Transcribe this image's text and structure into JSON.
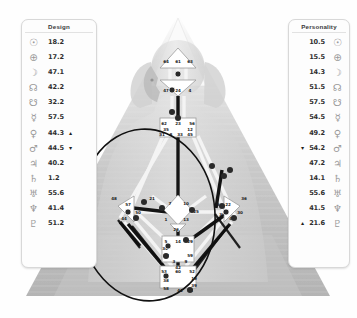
{
  "design": {
    "title": "Design",
    "rows": [
      {
        "icon": "sun-icon",
        "glyph": "☉",
        "value": "18.2",
        "arrow": ""
      },
      {
        "icon": "earth-icon",
        "glyph": "⊕",
        "value": "17.2",
        "arrow": ""
      },
      {
        "icon": "moon-icon",
        "glyph": "☽",
        "value": "47.1",
        "arrow": ""
      },
      {
        "icon": "north-node-icon",
        "glyph": "☊",
        "value": "42.2",
        "arrow": ""
      },
      {
        "icon": "south-node-icon",
        "glyph": "☋",
        "value": "32.2",
        "arrow": ""
      },
      {
        "icon": "mercury-icon",
        "glyph": "☿",
        "value": "57.5",
        "arrow": ""
      },
      {
        "icon": "venus-icon",
        "glyph": "♀",
        "value": "44.3",
        "arrow": "▲"
      },
      {
        "icon": "mars-icon",
        "glyph": "♂",
        "value": "44.5",
        "arrow": "▼"
      },
      {
        "icon": "jupiter-icon",
        "glyph": "♃",
        "value": "40.2",
        "arrow": ""
      },
      {
        "icon": "saturn-icon",
        "glyph": "♄",
        "value": "1.2",
        "arrow": ""
      },
      {
        "icon": "uranus-icon",
        "glyph": "♅",
        "value": "55.6",
        "arrow": ""
      },
      {
        "icon": "neptune-icon",
        "glyph": "♆",
        "value": "41.4",
        "arrow": ""
      },
      {
        "icon": "pluto-icon",
        "glyph": "♇",
        "value": "51.2",
        "arrow": ""
      }
    ]
  },
  "personality": {
    "title": "Personality",
    "rows": [
      {
        "icon": "sun-icon",
        "glyph": "☉",
        "value": "10.5",
        "arrow": ""
      },
      {
        "icon": "earth-icon",
        "glyph": "⊕",
        "value": "15.5",
        "arrow": ""
      },
      {
        "icon": "moon-icon",
        "glyph": "☽",
        "value": "14.3",
        "arrow": ""
      },
      {
        "icon": "north-node-icon",
        "glyph": "☊",
        "value": "51.5",
        "arrow": ""
      },
      {
        "icon": "south-node-icon",
        "glyph": "☋",
        "value": "57.5",
        "arrow": ""
      },
      {
        "icon": "mercury-icon",
        "glyph": "☿",
        "value": "54.5",
        "arrow": ""
      },
      {
        "icon": "venus-icon",
        "glyph": "♀",
        "value": "49.2",
        "arrow": ""
      },
      {
        "icon": "mars-icon",
        "glyph": "♂",
        "value": "54.2",
        "arrow": "▼"
      },
      {
        "icon": "jupiter-icon",
        "glyph": "♃",
        "value": "47.2",
        "arrow": ""
      },
      {
        "icon": "saturn-icon",
        "glyph": "♄",
        "value": "14.1",
        "arrow": ""
      },
      {
        "icon": "uranus-icon",
        "glyph": "♅",
        "value": "55.6",
        "arrow": ""
      },
      {
        "icon": "neptune-icon",
        "glyph": "♆",
        "value": "41.5",
        "arrow": ""
      },
      {
        "icon": "pluto-icon",
        "glyph": "♇",
        "value": "21.6",
        "arrow": "▲"
      }
    ]
  },
  "bodygraph": {
    "head_gates": [
      "64",
      "61",
      "63"
    ],
    "ajna_gates": [
      "47",
      "24",
      "4"
    ],
    "throat_gates_top": [
      "17",
      "11"
    ],
    "throat_gates": [
      "62",
      "23",
      "56",
      "35",
      "12",
      "31",
      "8",
      "33",
      "20",
      "16",
      "45",
      "24"
    ],
    "g_center_gates": [
      "7",
      "1",
      "13",
      "10",
      "25",
      "46",
      "2",
      "15"
    ],
    "heart_gates": [
      "21",
      "40",
      "26",
      "51"
    ],
    "spleen_gates": [
      "48",
      "57",
      "44",
      "50",
      "32",
      "28",
      "18"
    ],
    "sacral_gates": [
      "5",
      "14",
      "29",
      "34",
      "27",
      "42",
      "3",
      "9",
      "59"
    ],
    "solar_plexus_gates": [
      "6",
      "37",
      "22",
      "36",
      "30",
      "55",
      "49"
    ],
    "root_gates": [
      "53",
      "60",
      "52",
      "19",
      "39",
      "41",
      "38",
      "58",
      "54",
      "19"
    ],
    "colors": {
      "defined_channel": "#1a1a1a",
      "undefined_channel": "#f2f2f2",
      "center_fill": "#ffffff",
      "center_stroke": "#9b9b9b",
      "body_silhouette": "#d9d9d9",
      "triangle_fill": "#bdbdbd",
      "highlight_ellipse": "#111111"
    }
  }
}
